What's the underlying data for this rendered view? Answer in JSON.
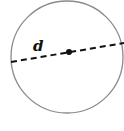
{
  "diagram": {
    "label": "d",
    "colors": {
      "circle_stroke": "#8a8a8a",
      "line": "#111111",
      "center_dot": "#111111"
    },
    "circle": {
      "cx": 67,
      "cy": 57,
      "r": 56
    },
    "diameter": {
      "x1": 11,
      "y1": 62,
      "x2": 124,
      "y2": 43
    },
    "center": {
      "x": 69,
      "y": 52
    }
  }
}
